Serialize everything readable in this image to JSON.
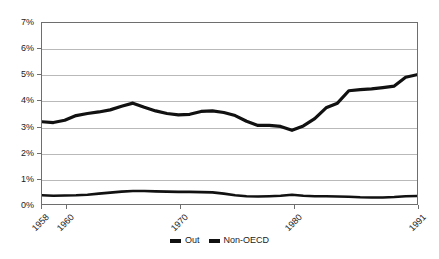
{
  "chart_data": {
    "type": "line",
    "title": "",
    "xlabel": "",
    "ylabel": "",
    "grid": true,
    "legend_position": "bottom",
    "xlim": [
      1958,
      1991
    ],
    "ylim": [
      0,
      7
    ],
    "y_ticks": [
      "0%",
      "1%",
      "2%",
      "3%",
      "4%",
      "5%",
      "6%",
      "7%"
    ],
    "y_tick_values": [
      0,
      1,
      2,
      3,
      4,
      5,
      6,
      7
    ],
    "x_ticks": [
      "1958",
      "1960",
      "1970",
      "1980",
      "1991"
    ],
    "x_tick_values": [
      1958,
      1960,
      1970,
      1980,
      1991
    ],
    "x": [
      1958,
      1959,
      1960,
      1961,
      1962,
      1963,
      1964,
      1965,
      1966,
      1967,
      1968,
      1969,
      1970,
      1971,
      1972,
      1973,
      1974,
      1975,
      1976,
      1977,
      1978,
      1979,
      1980,
      1981,
      1982,
      1983,
      1984,
      1985,
      1986,
      1987,
      1988,
      1989,
      1990,
      1991
    ],
    "series": [
      {
        "name": "Out",
        "color": "#111111",
        "values": [
          3.18,
          3.15,
          3.24,
          3.42,
          3.5,
          3.56,
          3.64,
          3.78,
          3.9,
          3.74,
          3.6,
          3.5,
          3.45,
          3.47,
          3.58,
          3.6,
          3.54,
          3.42,
          3.2,
          3.04,
          3.04,
          3.0,
          2.85,
          3.02,
          3.3,
          3.72,
          3.9,
          4.38,
          4.42,
          4.45,
          4.5,
          4.56,
          4.9,
          5.0
        ]
      },
      {
        "name": "Non-OECD",
        "color": "#111111",
        "values": [
          0.34,
          0.32,
          0.33,
          0.34,
          0.36,
          0.4,
          0.44,
          0.48,
          0.5,
          0.5,
          0.49,
          0.48,
          0.47,
          0.47,
          0.46,
          0.45,
          0.4,
          0.34,
          0.3,
          0.29,
          0.3,
          0.32,
          0.36,
          0.32,
          0.3,
          0.3,
          0.29,
          0.28,
          0.26,
          0.25,
          0.25,
          0.27,
          0.3,
          0.31
        ]
      }
    ]
  },
  "legend": {
    "entries": [
      {
        "label": "Out"
      },
      {
        "label": "Non-OECD"
      }
    ]
  }
}
